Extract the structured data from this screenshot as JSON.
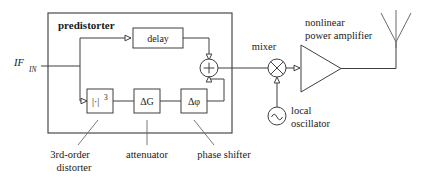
{
  "diagram": {
    "title_block": "predistorter",
    "input_label": {
      "base": "IF",
      "subscript": "IN"
    },
    "blocks": {
      "delay": "delay",
      "distorter": {
        "prefix": "|·|",
        "exponent": "3"
      },
      "attenuator": {
        "base": "ΔG"
      },
      "phase_shifter": {
        "base": "Δφ"
      }
    },
    "nodes": {
      "summer": "+",
      "mixer": "×",
      "oscillator": "∿"
    },
    "labels": {
      "mixer": "mixer",
      "amplifier_line1": "nonlinear",
      "amplifier_line2": "power amplifier",
      "oscillator_line1": "local",
      "oscillator_line2": "oscillator",
      "distorter_line1": "3rd-order",
      "distorter_line2": "distorter",
      "attenuator": "attenuator",
      "phase_shifter": "phase shifter"
    },
    "colors": {
      "wire": "#3f3f3f",
      "outline": "#4a4a4a",
      "leader": "#6a6a6a",
      "antenna": "#6b6b6b",
      "text": "#1a1a1a",
      "background": "#ffffff"
    }
  }
}
